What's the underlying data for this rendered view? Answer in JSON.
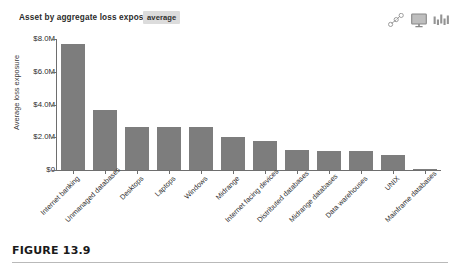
{
  "chart_header": {
    "title": "Asset by aggregate loss exposure",
    "metric_chip": "average",
    "icons": [
      {
        "name": "network-nodes-icon",
        "glyph": "nodes"
      },
      {
        "name": "monitor-icon",
        "glyph": "monitor"
      },
      {
        "name": "bar-chart-icon",
        "glyph": "bars"
      }
    ]
  },
  "caption": {
    "figure_label": "FIGURE 13.9"
  },
  "chart_data": {
    "type": "bar",
    "title": "Asset by aggregate loss exposure",
    "subtitle": "average",
    "xlabel": "",
    "ylabel": "Average loss exposure",
    "ylim": [
      0,
      8000000
    ],
    "grid": false,
    "legend": null,
    "y_ticks": [
      {
        "value": 0,
        "label": "$0"
      },
      {
        "value": 2000000,
        "label": "$2.0M"
      },
      {
        "value": 4000000,
        "label": "$4.0M"
      },
      {
        "value": 6000000,
        "label": "$6.0M"
      },
      {
        "value": 8000000,
        "label": "$8.0M"
      }
    ],
    "categories": [
      "Internet banking",
      "Unmanaged databases",
      "Desktops",
      "Laptops",
      "Windows",
      "Midrange",
      "Internet facing devices",
      "Distributed databases",
      "Midrange databases",
      "Data warehouses",
      "UNIX",
      "Mainframe databases"
    ],
    "values": [
      7700000,
      3650000,
      2600000,
      2600000,
      2650000,
      2000000,
      1750000,
      1250000,
      1150000,
      1150000,
      900000,
      70000
    ],
    "value_labels": [
      "$7.7M",
      "$3.65M",
      "$2.6M",
      "$2.6M",
      "$2.65M",
      "$2.0M",
      "$1.75M",
      "$1.25M",
      "$1.15M",
      "$1.15M",
      "$0.9M",
      "$0.07M"
    ],
    "bar_color": "#7d7d7d"
  }
}
